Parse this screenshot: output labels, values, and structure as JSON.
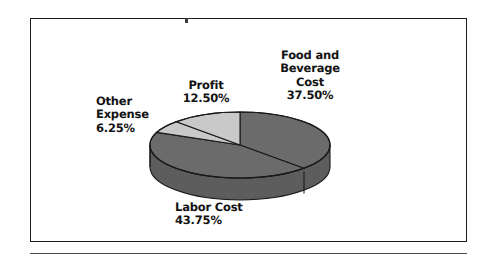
{
  "figure": {
    "background_color": "#ffffff",
    "frame_color": "#1c1c1c"
  },
  "chart_data": {
    "type": "pie",
    "title": "",
    "subtitle": "",
    "xlabel": "",
    "ylabel": "",
    "legend_position": "none",
    "grid": false,
    "three_d": true,
    "start_angle_deg": 0,
    "direction": "clockwise",
    "categories": [
      "Food and Beverage Cost",
      "Labor Cost",
      "Other Expense",
      "Profit"
    ],
    "values": [
      37.5,
      43.75,
      6.25,
      12.5
    ],
    "value_suffix": "%",
    "slice_colors": [
      "#6b6b6b",
      "#6b6b6b",
      "#c9c9c9",
      "#c9c9c9"
    ],
    "slices": [
      {
        "name": "Food and Beverage Cost",
        "value": 37.5,
        "label_lines": "Food and\nBeverage\nCost",
        "value_label": "37.50%",
        "color": "#6b6b6b",
        "tone": "dark"
      },
      {
        "name": "Labor Cost",
        "value": 43.75,
        "label_lines": "Labor Cost",
        "value_label": "43.75%",
        "color": "#6b6b6b",
        "tone": "dark"
      },
      {
        "name": "Other Expense",
        "value": 6.25,
        "label_lines": "Other\nExpense",
        "value_label": "6.25%",
        "color": "#c9c9c9",
        "tone": "light"
      },
      {
        "name": "Profit",
        "value": 12.5,
        "label_lines": "Profit",
        "value_label": "12.50%",
        "color": "#c9c9c9",
        "tone": "light"
      }
    ],
    "total": 100.0
  },
  "labels": {
    "food": {
      "name": "Food and\nBeverage\nCost",
      "value": "37.50%"
    },
    "profit": {
      "name": "Profit",
      "value": "12.50%"
    },
    "other": {
      "name": "Other\nExpense",
      "value": "6.25%"
    },
    "labor": {
      "name": "Labor Cost",
      "value": "43.75%"
    }
  },
  "colors": {
    "dark_slice": "#6b6b6b",
    "light_slice": "#c9c9c9",
    "side_dark": "#5d5d5d",
    "outline": "#1a1a1a",
    "text": "#131313"
  }
}
